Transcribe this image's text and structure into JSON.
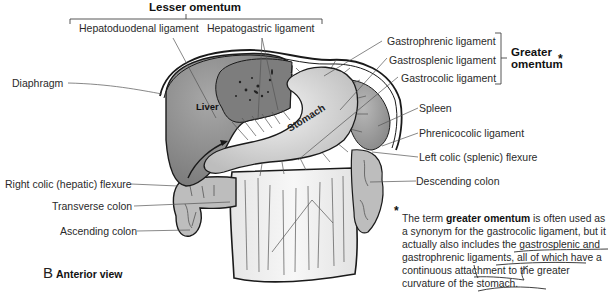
{
  "figure": {
    "panel_letter": "B",
    "panel_title": "Anterior view",
    "colors": {
      "liver": "#8c8c8c",
      "liver_left_lobe": "#7d7d7d",
      "stomach": "#d9d9d9",
      "omentum": "#efefef",
      "spleen": "#a3a3a3",
      "colon": "#bdbdbd",
      "outline": "#1a1a1a",
      "leader": "#555555"
    }
  },
  "groups": {
    "lesser_omentum": {
      "title": "Lesser omentum",
      "members": [
        "Hepatoduodenal ligament",
        "Hepatogastric ligament"
      ]
    },
    "greater_omentum": {
      "title_line1": "Greater",
      "title_line2": "omentum",
      "asterisk": "*",
      "members": [
        "Gastrophrenic ligament",
        "Gastrosplenic ligament",
        "Gastrocolic ligament"
      ]
    }
  },
  "labels": {
    "hepatoduodenal": "Hepatoduodenal ligament",
    "hepatogastric": "Hepatogastric ligament",
    "gastrophrenic": "Gastrophrenic ligament",
    "gastrosplenic": "Gastrosplenic ligament",
    "gastrocolic": "Gastrocolic ligament",
    "diaphragm": "Diaphragm",
    "spleen": "Spleen",
    "phrenicocolic": "Phrenicocolic ligament",
    "left_colic_flexure": "Left colic (splenic) flexure",
    "descending_colon": "Descending colon",
    "right_colic_flexure": "Right colic (hepatic) flexure",
    "transverse_colon": "Transverse colon",
    "ascending_colon": "Ascending colon",
    "liver": "Liver",
    "stomach": "Stomach"
  },
  "footnote": {
    "marker": "*",
    "text_before": "The term ",
    "bold_term": "greater omentum",
    "text_after": " is often used as a synonym for the gastrocolic ligament, but it actually also includes the gastrosplenic and gastrophrenic ligaments, all of which have a continuous attachment to the greater curvature of the stomach."
  }
}
